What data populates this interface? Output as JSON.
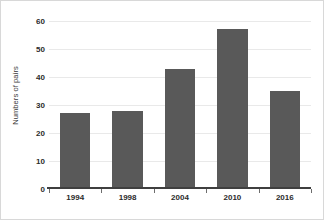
{
  "chart_data": {
    "type": "bar",
    "title": "",
    "xlabel": "",
    "ylabel": "Numbers of pairs",
    "categories": [
      "1994",
      "1998",
      "2004",
      "2010",
      "2016"
    ],
    "values": [
      27,
      28,
      43,
      57,
      35
    ],
    "ylim": [
      0,
      60
    ],
    "yticks": [
      0,
      10,
      20,
      30,
      40,
      50,
      60
    ],
    "ytick_labels": [
      "0",
      "10",
      "20",
      "30",
      "40",
      "50",
      "60"
    ],
    "grid": true,
    "grid_axis": "y",
    "legend": false,
    "legend_position": "none",
    "series": [
      {
        "name": "Numbers of pairs",
        "values": [
          27,
          28,
          43,
          57,
          35
        ],
        "color": "#595959"
      }
    ]
  },
  "colors": {
    "bar": "#595959",
    "gridline": "#e9e9e9",
    "axis": "#3f3f3f",
    "tick_text": "#2b2b2b",
    "label_text": "#3a3a3a",
    "frame": "#d8d8d8",
    "background": "#ffffff"
  }
}
